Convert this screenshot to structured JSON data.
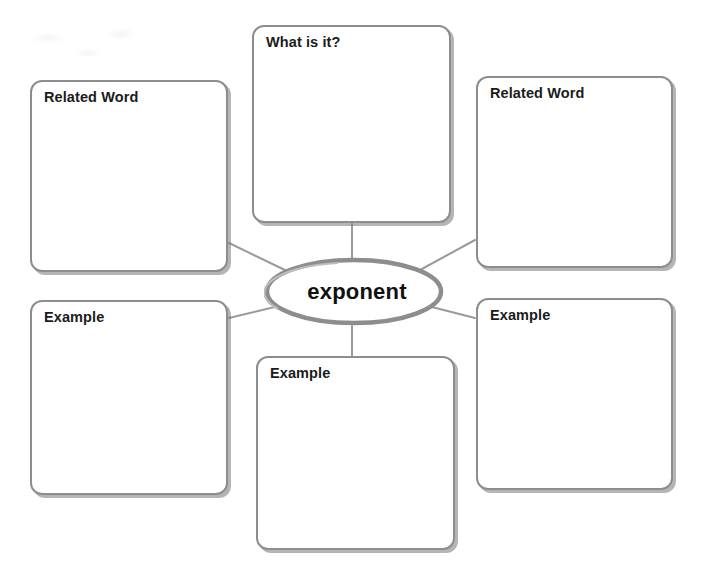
{
  "page": {
    "background_color": "#ffffff",
    "box_border_color": "#8d8d8d",
    "connector_color": "#9a9a9a",
    "text_color": "#1b1b1b"
  },
  "center": {
    "term": "exponent",
    "shape": "ellipse"
  },
  "boxes": [
    {
      "id": "top-center",
      "label": "What is it?"
    },
    {
      "id": "left-top",
      "label": "Related Word"
    },
    {
      "id": "right-top",
      "label": "Related Word"
    },
    {
      "id": "left-bottom",
      "label": "Example"
    },
    {
      "id": "right-bottom",
      "label": "Example"
    },
    {
      "id": "bottom-center",
      "label": "Example"
    }
  ]
}
